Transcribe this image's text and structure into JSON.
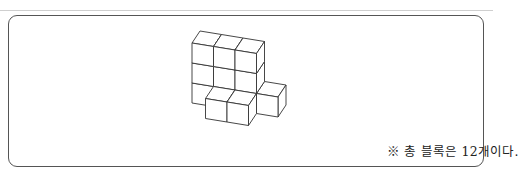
{
  "figure": {
    "line_color": "#333333",
    "face_color": "#ffffff"
  },
  "caption": {
    "text": "※ 총 블록은 12개이다."
  }
}
